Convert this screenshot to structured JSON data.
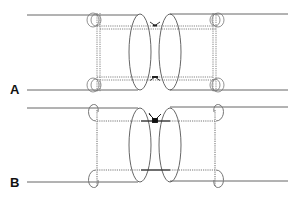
{
  "figure": {
    "panels": [
      {
        "id": "A",
        "label": "A",
        "description": "Two tubular ends approximated with looped sutures passed through both ends; suture knots untied at center",
        "tube_top_y": 15,
        "tube_bottom_y": 90,
        "suture_inner_y": [
          26,
          80
        ],
        "state": "untied"
      },
      {
        "id": "B",
        "label": "B",
        "description": "Sutures tied; knot at top center and solid tied segment at bottom",
        "tube_top_y": 108,
        "tube_bottom_y": 182,
        "suture_inner_y": [
          121,
          170
        ],
        "state": "tied"
      }
    ],
    "colors": {
      "line": "#555555",
      "suture": "#6a6a6a",
      "knot": "#111111",
      "background": "#ffffff"
    }
  }
}
